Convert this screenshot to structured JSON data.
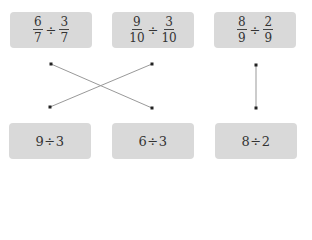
{
  "top_cards": [
    {
      "left": {
        "num": "6",
        "den": "7"
      },
      "op": "÷",
      "right": {
        "num": "3",
        "den": "7"
      }
    },
    {
      "left": {
        "num": "9",
        "den": "10"
      },
      "op": "÷",
      "right": {
        "num": "3",
        "den": "10"
      }
    },
    {
      "left": {
        "num": "8",
        "den": "9"
      },
      "op": "÷",
      "right": {
        "num": "2",
        "den": "9"
      }
    }
  ],
  "bottom_cards": [
    {
      "label": "9÷3"
    },
    {
      "label": "6÷3"
    },
    {
      "label": "8÷2"
    }
  ],
  "connections": [
    {
      "from": "top_cards.0",
      "to": "bottom_cards.1"
    },
    {
      "from": "top_cards.1",
      "to": "bottom_cards.0"
    },
    {
      "from": "top_cards.2",
      "to": "bottom_cards.2"
    }
  ],
  "colors": {
    "card_bg": "#d9d9d9",
    "line": "#999999",
    "dot": "#222222"
  }
}
